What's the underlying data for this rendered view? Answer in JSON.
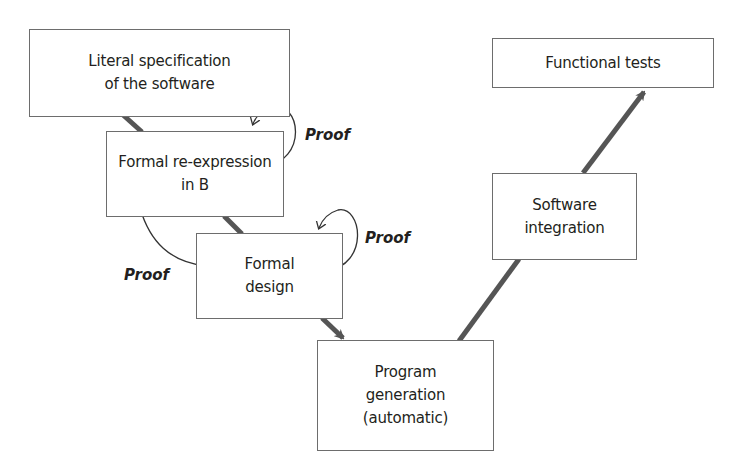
{
  "diagram": {
    "type": "V-cycle development process with B method",
    "colors": {
      "box_border": "#6d6d6d",
      "connector": "#555555",
      "text": "#231f20",
      "background": "#ffffff"
    },
    "boxes": [
      {
        "id": "literal-spec",
        "label": "Literal specification\nof the software"
      },
      {
        "id": "formal-reexpression",
        "label": "Formal re-expression\nin B"
      },
      {
        "id": "formal-design",
        "label": "Formal\ndesign"
      },
      {
        "id": "program-generation",
        "label": "Program\ngeneration\n(automatic)"
      },
      {
        "id": "software-integration",
        "label": "Software\nintegration"
      },
      {
        "id": "functional-tests",
        "label": "Functional tests"
      }
    ],
    "proof_labels": [
      {
        "id": "proof-1",
        "label": "Proof"
      },
      {
        "id": "proof-2",
        "label": "Proof"
      },
      {
        "id": "proof-3",
        "label": "Proof"
      }
    ],
    "edges": [
      {
        "from": "literal-spec",
        "to": "formal-reexpression",
        "style": "thick-line"
      },
      {
        "from": "formal-reexpression",
        "to": "formal-design",
        "style": "thick-line"
      },
      {
        "from": "formal-design",
        "to": "program-generation",
        "style": "thick-arrow"
      },
      {
        "from": "program-generation",
        "to": "software-integration",
        "style": "thick-line"
      },
      {
        "from": "software-integration",
        "to": "functional-tests",
        "style": "thick-arrow"
      },
      {
        "from": "formal-reexpression",
        "to": "literal-spec",
        "style": "curved-arrow",
        "label": "Proof"
      },
      {
        "from": "formal-design",
        "to": "formal-design",
        "style": "curved-arrow",
        "label": "Proof"
      },
      {
        "from": "formal-design",
        "to": "formal-reexpression",
        "style": "curved-arrow",
        "label": "Proof"
      }
    ]
  }
}
